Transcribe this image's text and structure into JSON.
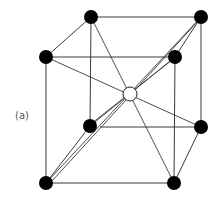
{
  "figure": {
    "label": "(a)",
    "colors": {
      "edge": "#3a3a3a",
      "corner_atom": "#000000",
      "center_atom_fill": "#ffffff",
      "center_atom_stroke": "#222222"
    },
    "atoms": {
      "back_top_left": [
        91,
        17
      ],
      "back_top_right": [
        201,
        17
      ],
      "front_top_left": [
        46,
        57
      ],
      "front_top_right": [
        175,
        57
      ],
      "back_bottom_left": [
        90,
        126
      ],
      "back_bottom_right": [
        201,
        127
      ],
      "front_bottom_left": [
        46,
        183
      ],
      "front_bottom_right": [
        174,
        183
      ],
      "body_center": [
        130,
        94
      ]
    }
  }
}
